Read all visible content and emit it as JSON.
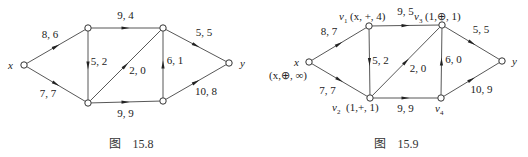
{
  "figures": [
    {
      "id": "fig-15-8",
      "caption": "图　15.8",
      "nodes": [
        {
          "id": "x",
          "label": "x",
          "sub": "",
          "mark": ""
        },
        {
          "id": "v1",
          "label": "",
          "sub": "",
          "mark": ""
        },
        {
          "id": "v2",
          "label": "",
          "sub": "",
          "mark": ""
        },
        {
          "id": "v3",
          "label": "",
          "sub": "",
          "mark": ""
        },
        {
          "id": "v4",
          "label": "",
          "sub": "",
          "mark": ""
        },
        {
          "id": "y",
          "label": "y",
          "sub": "",
          "mark": ""
        }
      ],
      "edges": [
        {
          "from": "x",
          "to": "v1",
          "label": "8, 6"
        },
        {
          "from": "x",
          "to": "v2",
          "label": "7, 7"
        },
        {
          "from": "v1",
          "to": "v3",
          "label": "9, 4"
        },
        {
          "from": "v1",
          "to": "v2",
          "label": "5, 2"
        },
        {
          "from": "v2",
          "to": "v3",
          "label": "2, 0"
        },
        {
          "from": "v2",
          "to": "v4",
          "label": "9, 9"
        },
        {
          "from": "v4",
          "to": "v3",
          "label": "6, 1"
        },
        {
          "from": "v3",
          "to": "y",
          "label": "5, 5"
        },
        {
          "from": "v4",
          "to": "y",
          "label": "10, 8"
        }
      ]
    },
    {
      "id": "fig-15-9",
      "caption": "图　15.9",
      "nodes": [
        {
          "id": "x",
          "label": "x",
          "sub": "",
          "mark": "(x,⊕, ∞)"
        },
        {
          "id": "v1",
          "label": "v",
          "sub": "1",
          "mark": "(x, +, 4)"
        },
        {
          "id": "v2",
          "label": "v",
          "sub": "2",
          "mark": "(1,+, 1)"
        },
        {
          "id": "v3",
          "label": "v",
          "sub": "3",
          "mark": "(1,⊕, 1)"
        },
        {
          "id": "v4",
          "label": "v",
          "sub": "4",
          "mark": ""
        },
        {
          "id": "y",
          "label": "y",
          "sub": "",
          "mark": ""
        }
      ],
      "edges": [
        {
          "from": "x",
          "to": "v1",
          "label": "8, 7"
        },
        {
          "from": "x",
          "to": "v2",
          "label": "7, 7"
        },
        {
          "from": "v1",
          "to": "v3",
          "label": "9, 5"
        },
        {
          "from": "v1",
          "to": "v2",
          "label": "5, 2"
        },
        {
          "from": "v2",
          "to": "v3",
          "label": "2, 0"
        },
        {
          "from": "v2",
          "to": "v4",
          "label": "9, 9"
        },
        {
          "from": "v4",
          "to": "v3",
          "label": "6, 0"
        },
        {
          "from": "v3",
          "to": "y",
          "label": "5, 5"
        },
        {
          "from": "v4",
          "to": "y",
          "label": "10, 9"
        }
      ]
    }
  ]
}
